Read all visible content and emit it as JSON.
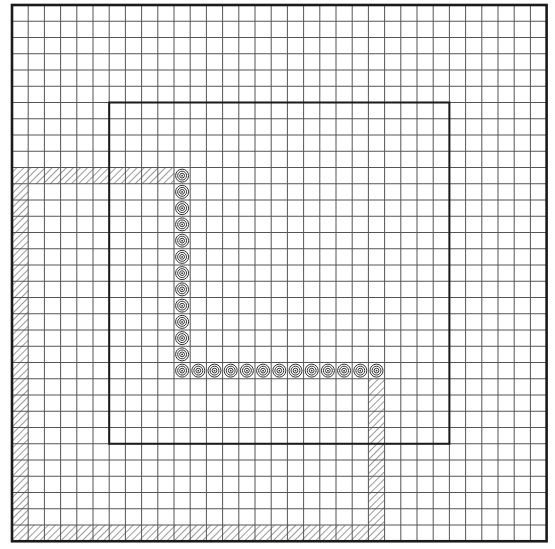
{
  "diagram": {
    "grid": {
      "columns": 33,
      "rows": 33,
      "origin_x": 12,
      "origin_y": 5,
      "cell_width": 16.2,
      "cell_height": 16.25,
      "line_color": "#555555",
      "border_color": "#1a1a1a"
    },
    "inner_square": {
      "col_start": 6,
      "row_start": 6,
      "col_end": 27,
      "row_end": 27
    },
    "hatched_regions": [
      {
        "name": "top-hatched-row",
        "row": 10,
        "col_start": 0,
        "col_end": 9
      },
      {
        "name": "left-hatched-column",
        "col": 0,
        "row_start": 11,
        "row_end": 32
      },
      {
        "name": "bottom-hatched-row",
        "row": 32,
        "col_start": 1,
        "col_end": 22
      },
      {
        "name": "right-hatched-column",
        "col": 22,
        "row_start": 23,
        "row_end": 31
      }
    ],
    "circle_markers": {
      "vertical": {
        "col": 10,
        "row_start": 10,
        "row_end": 22
      },
      "horizontal": {
        "row": 22,
        "col_start": 11,
        "col_end": 22
      },
      "total_count": 25,
      "ring_count": 3
    }
  }
}
